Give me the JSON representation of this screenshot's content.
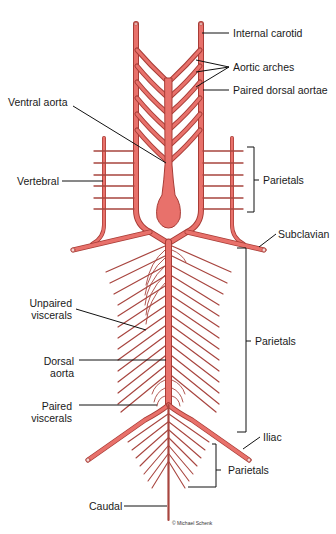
{
  "diagram": {
    "type": "anatomical-diagram",
    "colors": {
      "vessel_fill": "#e8716b",
      "vessel_outline": "#a83c36",
      "thin_vessel": "#a8453f",
      "leader_line": "#111111",
      "background": "#ffffff"
    },
    "labels": {
      "internal_carotid": "Internal carotid",
      "aortic_arches": "Aortic arches",
      "paired_dorsal_aortae": "Paired dorsal aortae",
      "ventral_aorta": "Ventral aorta",
      "vertebral": "Vertebral",
      "parietals_upper": "Parietals",
      "subclavian": "Subclavian",
      "unpaired_viscerals_line1": "Unpaired",
      "unpaired_viscerals_line2": "viscerals",
      "parietals_middle": "Parietals",
      "dorsal_aorta_line1": "Dorsal",
      "dorsal_aorta_line2": "aorta",
      "paired_viscerals_line1": "Paired",
      "paired_viscerals_line2": "viscerals",
      "iliac": "Iliac",
      "parietals_lower": "Parietals",
      "caudal": "Caudal"
    },
    "copyright": "© Michael Schenk",
    "aortic_arch_count_per_side": 6
  }
}
